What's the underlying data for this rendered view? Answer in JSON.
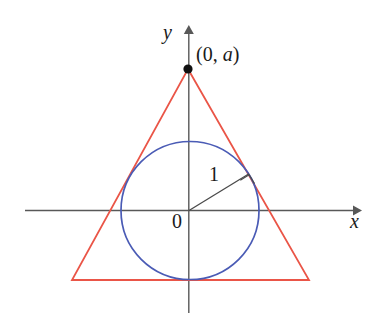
{
  "figure": {
    "background_color": "#ffffff",
    "axis_color": "#555555",
    "triangle_color": "#ea5547",
    "circle_color": "#4a5bb5",
    "radius_line_color": "#4a4a4a",
    "point_color": "#111111",
    "text_color": "#1a1a1a"
  },
  "labels": {
    "y_axis": "y",
    "x_axis": "x",
    "origin": "0",
    "apex_point": "(0, a)",
    "radius": "1"
  },
  "chart_data": {
    "type": "scatter",
    "xlabel": "x",
    "ylabel": "y",
    "grid": false,
    "legend": null,
    "axes": {
      "origin_px": [
        189,
        210
      ],
      "x_axis_start_px": [
        25,
        210
      ],
      "x_axis_end_px": [
        360,
        210
      ],
      "y_axis_top_px": [
        189,
        27
      ],
      "y_axis_bottom_px": [
        189,
        313
      ],
      "arrow_heads": [
        "x-positive",
        "y-positive"
      ]
    },
    "shapes": [
      {
        "name": "inscribed-circle",
        "type": "circle",
        "center_px": [
          190,
          210
        ],
        "radius_px": 69,
        "stroke": "#4a5bb5",
        "fill": "none",
        "math_radius": 1
      },
      {
        "name": "circumscribing-triangle",
        "type": "polygon",
        "vertices_px": [
          [
            188,
            69
          ],
          [
            309,
            280
          ],
          [
            72,
            280
          ]
        ],
        "stroke": "#ea5547",
        "fill": "none"
      },
      {
        "name": "radius-segment",
        "type": "line",
        "from_px": [
          189,
          210
        ],
        "to_px": [
          248,
          174
        ],
        "stroke": "#4a4a4a",
        "label": "1"
      },
      {
        "name": "right-angle-marker",
        "type": "square-marker",
        "vertex_px": [
          248,
          174
        ],
        "size_px": 11,
        "stroke": "#4a4a4a"
      },
      {
        "name": "apex-point",
        "type": "point",
        "position_px": [
          188,
          69
        ],
        "fill": "#111111",
        "radius_px": 4.5,
        "label": "(0, a)"
      }
    ],
    "annotations": [
      {
        "text": "y",
        "at_px": [
          170,
          32
        ],
        "style": "italic-serif"
      },
      {
        "text": "x",
        "at_px": [
          356,
          222
        ],
        "style": "italic-serif"
      },
      {
        "text": "0",
        "at_px": [
          178,
          222
        ],
        "style": "serif"
      },
      {
        "text": "(0, a)",
        "at_px": [
          220,
          55
        ],
        "style": "serif-with-italic-a"
      },
      {
        "text": "1",
        "at_px": [
          214,
          175
        ],
        "style": "serif"
      }
    ]
  }
}
